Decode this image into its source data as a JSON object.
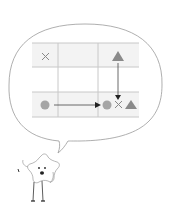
{
  "diagram": {
    "colors": {
      "grid_line": "#cccccc",
      "row_fill": "#f2f2f2",
      "shape": "#999999",
      "arrow": "#333333",
      "bubble_stroke": "#999999"
    },
    "grid": {
      "rows": 3,
      "cols": 3,
      "cells": [
        {
          "row": 0,
          "col": 0,
          "symbol": "cross"
        },
        {
          "row": 0,
          "col": 2,
          "symbol": "triangle"
        },
        {
          "row": 2,
          "col": 0,
          "symbol": "circle"
        },
        {
          "row": 2,
          "col": 2,
          "symbol": "circle, cross, triangle"
        }
      ],
      "arrows": [
        {
          "from": "row 2 col 0 circle",
          "to": "row 2 col 2 circle",
          "direction": "right"
        },
        {
          "from": "row 0 col 2 triangle",
          "to": "row 2 col 2",
          "direction": "down"
        }
      ]
    },
    "mascot": "star-character"
  }
}
